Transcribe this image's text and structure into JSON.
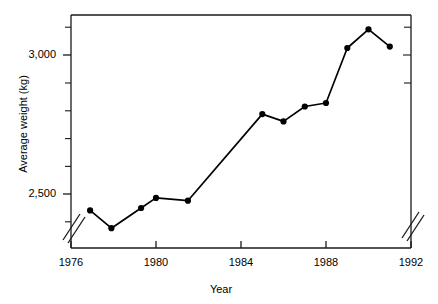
{
  "chart_data": {
    "type": "line",
    "title": "",
    "xlabel": "Year",
    "ylabel": "Average weight (kg)",
    "xlim": [
      1976,
      1992
    ],
    "ylim": [
      2450,
      3120
    ],
    "xticks": [
      1976,
      1980,
      1984,
      1988,
      1992
    ],
    "xtick_labels": [
      "1976",
      "1980",
      "1984",
      "1988",
      "1992"
    ],
    "yticks": [
      2500,
      3000
    ],
    "ytick_labels": [
      "2,500",
      "3,000"
    ],
    "y_minor_ticks": [
      2550,
      2600,
      2650,
      2700,
      2750,
      2800,
      2850,
      2900,
      2950,
      3050,
      3100
    ],
    "grid": false,
    "legend": null,
    "axis_break_x": true,
    "axis_break_y": true,
    "marker": "filled-circle",
    "line_color": "#000000",
    "marker_color": "#000000",
    "x": [
      1976.9,
      1977.9,
      1979.3,
      1980.0,
      1981.5,
      1985.0,
      1986.0,
      1987.0,
      1988.0,
      1989.0,
      1990.0,
      1991.0
    ],
    "values": [
      2558,
      2507,
      2565,
      2594,
      2586,
      2835,
      2814,
      2857,
      2867,
      3025,
      3079,
      3029
    ],
    "series": [
      {
        "name": "Average weight",
        "x": [
          1976.9,
          1977.9,
          1979.3,
          1980.0,
          1981.5,
          1985.0,
          1986.0,
          1987.0,
          1988.0,
          1989.0,
          1990.0,
          1991.0
        ],
        "values": [
          2558,
          2507,
          2565,
          2594,
          2586,
          2835,
          2814,
          2857,
          2867,
          3025,
          3079,
          3029
        ]
      }
    ]
  },
  "axis": {
    "y_label_top": "3,000",
    "y_label_bottom": "2,500",
    "y_title": "Average weight (kg)",
    "x_title": "Year",
    "x_label_1": "1976",
    "x_label_2": "1980",
    "x_label_3": "1984",
    "x_label_4": "1988",
    "x_label_5": "1992"
  }
}
